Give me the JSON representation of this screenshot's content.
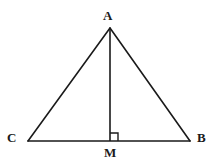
{
  "figure": {
    "background_color": "#ffffff",
    "stroke_color": "#1a1a1a",
    "label_color": "#1a1a1a",
    "canvas": {
      "width": 216,
      "height": 167
    }
  },
  "labels": {
    "apex": "A",
    "left_base": "C",
    "right_base": "B",
    "foot": "M"
  },
  "points": {
    "A": {
      "x": 110,
      "y": 28
    },
    "B": {
      "x": 190,
      "y": 141
    },
    "C": {
      "x": 28,
      "y": 141
    },
    "M": {
      "x": 110,
      "y": 141
    }
  },
  "segments": [
    {
      "name": "side-CA",
      "from": "C",
      "to": "A",
      "stroke_width": 1.6
    },
    {
      "name": "side-AB",
      "from": "A",
      "to": "B",
      "stroke_width": 1.6
    },
    {
      "name": "base-CB",
      "from": "C",
      "to": "B",
      "stroke_width": 1.6
    },
    {
      "name": "altitude-AM",
      "from": "A",
      "to": "M",
      "stroke_width": 1.6
    }
  ],
  "right_angle_marker": {
    "name": "right-angle-at-M",
    "at": "M",
    "size": 8,
    "orientation": "up-right",
    "stroke_width": 1.4
  }
}
